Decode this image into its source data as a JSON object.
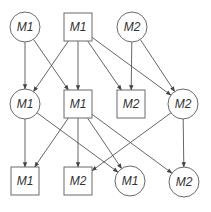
{
  "diagram": {
    "type": "layered-directed-graph",
    "colors": {
      "stroke": "#6a6a6a",
      "edge": "#555555",
      "text": "#333333",
      "background": "#ffffff"
    },
    "nodes": [
      {
        "id": "r1c1",
        "label": "M1",
        "shape": "circle",
        "x": 25,
        "y": 27
      },
      {
        "id": "r1c2",
        "label": "M1",
        "shape": "square",
        "x": 78,
        "y": 27
      },
      {
        "id": "r1c3",
        "label": "M2",
        "shape": "circle",
        "x": 132,
        "y": 27
      },
      {
        "id": "r2c1",
        "label": "M1",
        "shape": "circle",
        "x": 25,
        "y": 104
      },
      {
        "id": "r2c2",
        "label": "M1",
        "shape": "square",
        "x": 78,
        "y": 104
      },
      {
        "id": "r2c3",
        "label": "M2",
        "shape": "square",
        "x": 131,
        "y": 104
      },
      {
        "id": "r2c4",
        "label": "M2",
        "shape": "circle",
        "x": 183,
        "y": 104
      },
      {
        "id": "r3c1",
        "label": "M1",
        "shape": "square",
        "x": 25,
        "y": 181
      },
      {
        "id": "r3c2",
        "label": "M2",
        "shape": "square",
        "x": 78,
        "y": 181
      },
      {
        "id": "r3c3",
        "label": "M1",
        "shape": "circle",
        "x": 130,
        "y": 181
      },
      {
        "id": "r3c4",
        "label": "M2",
        "shape": "circle",
        "x": 184,
        "y": 182
      }
    ],
    "edges": [
      {
        "from": "r1c1",
        "to": "r2c1"
      },
      {
        "from": "r1c1",
        "to": "r2c2"
      },
      {
        "from": "r1c2",
        "to": "r2c1"
      },
      {
        "from": "r1c2",
        "to": "r2c2"
      },
      {
        "from": "r1c2",
        "to": "r2c3"
      },
      {
        "from": "r1c2",
        "to": "r2c4"
      },
      {
        "from": "r1c3",
        "to": "r2c3"
      },
      {
        "from": "r1c3",
        "to": "r2c4"
      },
      {
        "from": "r2c1",
        "to": "r3c1"
      },
      {
        "from": "r2c1",
        "to": "r3c3"
      },
      {
        "from": "r2c2",
        "to": "r3c1"
      },
      {
        "from": "r2c2",
        "to": "r3c2"
      },
      {
        "from": "r2c2",
        "to": "r3c3"
      },
      {
        "from": "r2c2",
        "to": "r3c4"
      },
      {
        "from": "r2c4",
        "to": "r3c2"
      },
      {
        "from": "r2c4",
        "to": "r3c4"
      }
    ]
  }
}
